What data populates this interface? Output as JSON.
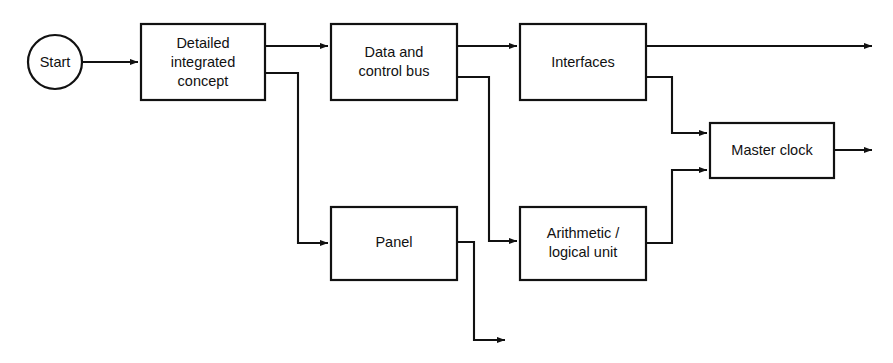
{
  "diagram": {
    "type": "flowchart",
    "title": "",
    "background_color": "#ffffff",
    "line_color": "#111111",
    "box_fill_color": "#ffffff",
    "nodes": [
      {
        "id": "start",
        "shape": "circle",
        "label": "Start",
        "lines": [
          "Start"
        ],
        "cx": 55,
        "cy": 62,
        "r": 27
      },
      {
        "id": "detailed-integrated-concept",
        "shape": "rectangle",
        "label": "Detailed integrated concept",
        "lines": [
          "Detailed",
          "integrated",
          "concept"
        ],
        "x": 141,
        "y": 24,
        "w": 124,
        "h": 76
      },
      {
        "id": "data-and-control-bus",
        "shape": "rectangle",
        "label": "Data and control bus",
        "lines": [
          "Data and",
          "control bus"
        ],
        "x": 331,
        "y": 24,
        "w": 126,
        "h": 76
      },
      {
        "id": "interfaces",
        "shape": "rectangle",
        "label": "Interfaces",
        "lines": [
          "Interfaces"
        ],
        "x": 520,
        "y": 24,
        "w": 126,
        "h": 76
      },
      {
        "id": "master-clock",
        "shape": "rectangle",
        "label": "Master clock",
        "lines": [
          "Master clock"
        ],
        "x": 710,
        "y": 123,
        "w": 124,
        "h": 55
      },
      {
        "id": "panel",
        "shape": "rectangle",
        "label": "Panel",
        "lines": [
          "Panel"
        ],
        "x": 331,
        "y": 207,
        "w": 126,
        "h": 73
      },
      {
        "id": "arithmetic-logical-unit",
        "shape": "rectangle",
        "label": "Arithmetic / logical unit",
        "lines": [
          "Arithmetic /",
          "logical unit"
        ],
        "x": 520,
        "y": 207,
        "w": 126,
        "h": 73
      }
    ],
    "edges": [
      {
        "id": "start-to-concept",
        "from": "start",
        "to": "detailed-integrated-concept",
        "arrowhead": true
      },
      {
        "id": "concept-to-bus",
        "from": "detailed-integrated-concept",
        "to": "data-and-control-bus",
        "arrowhead": true
      },
      {
        "id": "concept-to-panel",
        "from": "detailed-integrated-concept",
        "to": "panel",
        "arrowhead": true
      },
      {
        "id": "bus-to-interfaces",
        "from": "data-and-control-bus",
        "to": "interfaces",
        "arrowhead": true
      },
      {
        "id": "bus-to-alu",
        "from": "data-and-control-bus",
        "to": "arithmetic-logical-unit",
        "arrowhead": true
      },
      {
        "id": "interfaces-to-exit-right",
        "from": "interfaces",
        "to": "",
        "arrowhead": true
      },
      {
        "id": "interfaces-to-master-clock",
        "from": "interfaces",
        "to": "master-clock",
        "arrowhead": true
      },
      {
        "id": "alu-to-master-clock",
        "from": "arithmetic-logical-unit",
        "to": "master-clock",
        "arrowhead": true
      },
      {
        "id": "master-clock-to-exit-right",
        "from": "master-clock",
        "to": "",
        "arrowhead": true
      },
      {
        "id": "panel-to-exit-bottom",
        "from": "panel",
        "to": "",
        "arrowhead": true
      }
    ]
  }
}
